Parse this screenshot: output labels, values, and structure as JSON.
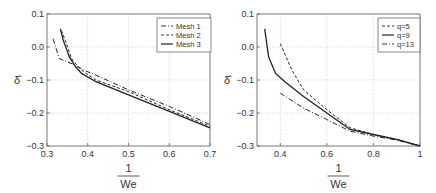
{
  "chart_data": [
    {
      "type": "line",
      "title": "",
      "xlabel_num": "1",
      "xlabel_den": "We",
      "ylabel": "δ̂",
      "xlim": [
        0.3,
        0.7
      ],
      "ylim": [
        -0.3,
        0.1
      ],
      "xticks": [
        "0.3",
        "0.4",
        "0.5",
        "0.6",
        "0.7"
      ],
      "yticks": [
        "0.1",
        "0.0",
        "−0.1",
        "−0.2",
        "−0.3"
      ],
      "grid": true,
      "legend_position": "upper right",
      "series": [
        {
          "name": "Mesh 1",
          "style": "dashdot",
          "x": [
            0.315,
            0.33,
            0.37,
            0.39,
            0.42,
            0.5,
            0.6,
            0.7
          ],
          "y": [
            0.025,
            -0.035,
            -0.055,
            -0.07,
            -0.085,
            -0.13,
            -0.18,
            -0.235
          ]
        },
        {
          "name": "Mesh 2",
          "style": "dashed",
          "x": [
            0.335,
            0.345,
            0.36,
            0.38,
            0.39,
            0.42,
            0.5,
            0.6,
            0.7
          ],
          "y": [
            0.05,
            0.02,
            -0.035,
            -0.065,
            -0.075,
            -0.1,
            -0.135,
            -0.19,
            -0.24
          ]
        },
        {
          "name": "Mesh 3",
          "style": "solid",
          "x": [
            0.333,
            0.34,
            0.355,
            0.37,
            0.385,
            0.42,
            0.5,
            0.6,
            0.7
          ],
          "y": [
            0.055,
            0.02,
            -0.03,
            -0.06,
            -0.08,
            -0.105,
            -0.145,
            -0.195,
            -0.245
          ]
        }
      ]
    },
    {
      "type": "line",
      "title": "",
      "xlabel_num": "1",
      "xlabel_den": "We",
      "ylabel": "δ̂",
      "xlim": [
        0.3,
        1.0
      ],
      "ylim": [
        -0.3,
        0.1
      ],
      "xticks": [
        "0.4",
        "0.6",
        "0.8",
        "1"
      ],
      "yticks": [
        "0.1",
        "0.0",
        "−0.1",
        "−0.2",
        "−0.3"
      ],
      "grid": true,
      "legend_position": "upper right",
      "series": [
        {
          "name": "q=5",
          "style": "dashed",
          "x": [
            0.4,
            0.45,
            0.5,
            0.6,
            0.7,
            0.8,
            0.9,
            1.0
          ],
          "y": [
            0.01,
            -0.07,
            -0.13,
            -0.19,
            -0.245,
            -0.265,
            -0.28,
            -0.3
          ]
        },
        {
          "name": "q=9",
          "style": "solid",
          "x": [
            0.333,
            0.35,
            0.38,
            0.42,
            0.5,
            0.6,
            0.7,
            0.8,
            0.9,
            1.0
          ],
          "y": [
            0.055,
            -0.03,
            -0.08,
            -0.105,
            -0.15,
            -0.2,
            -0.25,
            -0.265,
            -0.28,
            -0.3
          ]
        },
        {
          "name": "q=13",
          "style": "dashdot",
          "x": [
            0.4,
            0.5,
            0.6,
            0.7,
            0.8,
            0.9,
            1.0
          ],
          "y": [
            -0.14,
            -0.185,
            -0.22,
            -0.255,
            -0.27,
            -0.282,
            -0.3
          ]
        }
      ]
    }
  ]
}
